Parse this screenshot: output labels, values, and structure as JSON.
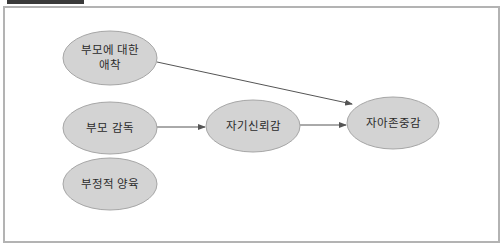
{
  "diagram": {
    "colors": {
      "node_fill": "#d3d3d3",
      "node_stroke": "#a6a6a6",
      "edge": "#555555",
      "frame_border": "#b3b3b3",
      "tab": "#3a3a3a"
    },
    "nodes": [
      {
        "id": "attachment",
        "lines": [
          "부모에 대한",
          "애착"
        ],
        "cx": 110,
        "cy": 58
      },
      {
        "id": "supervision",
        "lines": [
          "부모 감독"
        ],
        "cx": 110,
        "cy": 128
      },
      {
        "id": "negative_parenting",
        "lines": [
          "부정적 양육"
        ],
        "cx": 110,
        "cy": 184
      },
      {
        "id": "self_confidence",
        "lines": [
          "자기신뢰감"
        ],
        "cx": 253,
        "cy": 126
      },
      {
        "id": "self_esteem",
        "lines": [
          "자아존중감"
        ],
        "cx": 393,
        "cy": 123
      }
    ],
    "edges": [
      {
        "from": "attachment",
        "to": "self_esteem"
      },
      {
        "from": "supervision",
        "to": "self_confidence"
      },
      {
        "from": "self_confidence",
        "to": "self_esteem"
      }
    ]
  }
}
